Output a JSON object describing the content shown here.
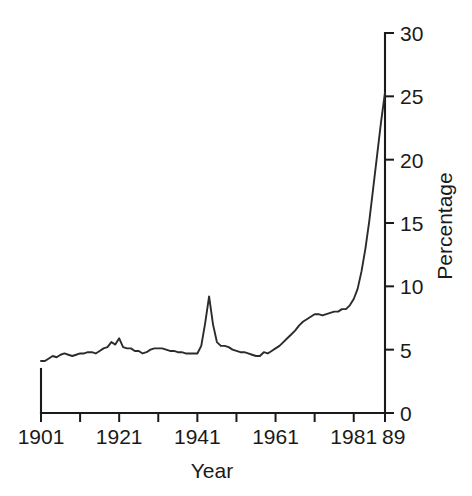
{
  "chart_data": {
    "type": "line",
    "title": "",
    "xlabel": "Year",
    "ylabel": "Percentage",
    "xlim": [
      1901,
      1989
    ],
    "ylim": [
      0,
      30
    ],
    "grid": false,
    "legend": false,
    "x_tick_labels": [
      "1901",
      "1921",
      "1941",
      "1961",
      "1981",
      "89"
    ],
    "x_tick_values": [
      1901,
      1921,
      1941,
      1961,
      1981,
      1989
    ],
    "x_minor_tick_values": [
      1911,
      1931,
      1951,
      1971
    ],
    "y_tick_labels": [
      "0",
      "5",
      "10",
      "15",
      "20",
      "25",
      "30"
    ],
    "y_tick_values": [
      0,
      5,
      10,
      15,
      20,
      25,
      30
    ],
    "y_axis_position": "right",
    "x": [
      1901,
      1902,
      1903,
      1904,
      1905,
      1906,
      1907,
      1908,
      1909,
      1910,
      1911,
      1912,
      1913,
      1914,
      1915,
      1916,
      1917,
      1918,
      1919,
      1920,
      1921,
      1922,
      1923,
      1924,
      1925,
      1926,
      1927,
      1928,
      1929,
      1930,
      1931,
      1932,
      1933,
      1934,
      1935,
      1936,
      1937,
      1938,
      1939,
      1940,
      1941,
      1942,
      1943,
      1944,
      1945,
      1946,
      1947,
      1948,
      1949,
      1950,
      1951,
      1952,
      1953,
      1954,
      1955,
      1956,
      1957,
      1958,
      1959,
      1960,
      1961,
      1962,
      1963,
      1964,
      1965,
      1966,
      1967,
      1968,
      1969,
      1970,
      1971,
      1972,
      1973,
      1974,
      1975,
      1976,
      1977,
      1978,
      1979,
      1980,
      1981,
      1982,
      1983,
      1984,
      1985,
      1986,
      1987,
      1988,
      1989
    ],
    "values": [
      4.1,
      4.1,
      4.3,
      4.5,
      4.4,
      4.6,
      4.7,
      4.6,
      4.5,
      4.6,
      4.7,
      4.7,
      4.8,
      4.8,
      4.7,
      4.9,
      5.1,
      5.2,
      5.6,
      5.4,
      5.9,
      5.2,
      5.1,
      5.1,
      4.9,
      4.9,
      4.7,
      4.8,
      5.0,
      5.1,
      5.1,
      5.1,
      5.0,
      4.9,
      4.9,
      4.8,
      4.8,
      4.7,
      4.7,
      4.7,
      4.7,
      5.3,
      7.1,
      9.2,
      7.0,
      5.6,
      5.3,
      5.3,
      5.2,
      5.0,
      4.9,
      4.8,
      4.8,
      4.7,
      4.6,
      4.5,
      4.5,
      4.8,
      4.7,
      4.9,
      5.1,
      5.3,
      5.6,
      5.9,
      6.2,
      6.5,
      6.9,
      7.2,
      7.4,
      7.6,
      7.8,
      7.8,
      7.7,
      7.8,
      7.9,
      8.0,
      8.0,
      8.2,
      8.2,
      8.5,
      9.0,
      9.8,
      11.2,
      13.0,
      15.2,
      17.8,
      20.4,
      23.0,
      25.3
    ],
    "line_color": "#2b2b2b",
    "background_color": "#ffffff",
    "notes": [
      "Line chart with axis frame on left bottom and right sides only",
      "Y axis drawn on the right-hand side of the plot",
      "Sharp peak circa 1944 near 9 percent",
      "Smaller bump circa 1919-1921 near 5.5-6 percent",
      "Steep exponential-looking rise from about 1981 to 1989"
    ]
  }
}
